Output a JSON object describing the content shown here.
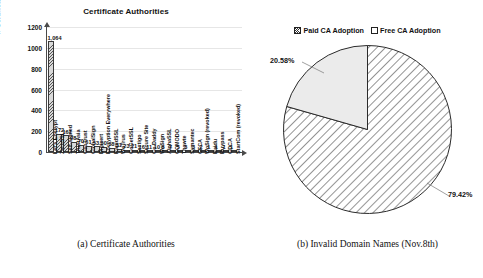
{
  "figure": {
    "caption_a": "(a) Certificate Authorities",
    "caption_b": "(b) Invalid Domain Names (Nov.8th)"
  },
  "chart_data": [
    {
      "type": "bar",
      "title": "Certificate Authorities",
      "xlabel": "",
      "ylabel": "# Certificate",
      "ylim": [
        0,
        1200
      ],
      "yticks": [
        0,
        200,
        400,
        600,
        800,
        1000,
        1200
      ],
      "ytick_labels": [
        "0",
        "200",
        "400",
        "600",
        "800",
        "1000",
        "1200"
      ],
      "grid": true,
      "legend": "none",
      "categories": [
        "Let's Encrypt",
        "ZeroSSL",
        "Self-signed",
        "TrustAsia",
        "GeoTrust",
        "GlobalSign",
        "Digicert",
        "Encryption Everywhere",
        "RapidSSL",
        "WoTrus",
        "GoGetSSL",
        "Sectigo",
        "Secure Site",
        "Go Daddy",
        "WoSign",
        "AlphaSSL",
        "COMODO",
        "Thawte",
        "Symantec",
        "CFCA",
        "WoSign (revoked)",
        "Baidu",
        "Buypass",
        "GDCA",
        "StartCom (revoked)"
      ],
      "values": [
        1064,
        172,
        161,
        98,
        70,
        61,
        53,
        50,
        38,
        31,
        23,
        21,
        16,
        11,
        10,
        8,
        7,
        5,
        3,
        3,
        2,
        1,
        1,
        1,
        1
      ],
      "value_labels": [
        "1,064",
        "172",
        "161",
        "98",
        "70",
        "61",
        "53",
        "50",
        "38",
        "31",
        "23",
        "21",
        "16",
        "11",
        "10",
        "8",
        "7",
        "5",
        "3",
        "3",
        "2",
        "1",
        "1",
        "1",
        "1"
      ]
    },
    {
      "type": "pie",
      "title": "",
      "legend_position": "top",
      "labels": [
        "Paid CA Adoption",
        "Free CA Adoption"
      ],
      "values": [
        79.42,
        20.58
      ],
      "value_labels": [
        "79.42%",
        "20.58%"
      ]
    }
  ]
}
